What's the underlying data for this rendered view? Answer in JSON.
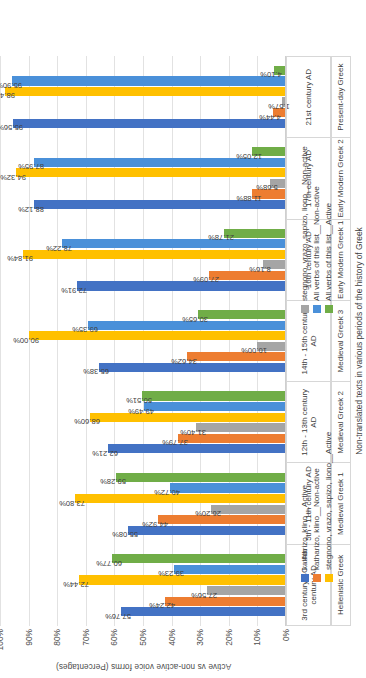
{
  "chart_data": {
    "type": "bar",
    "title": "",
    "ylabel": "Active vs non-active voice forms (Percentages)",
    "xlabel": "Non-translated texts in various periods of the history of Greek",
    "ylim": [
      0,
      100
    ],
    "ytick_labels": [
      "0%",
      "10%",
      "20%",
      "30%",
      "40%",
      "50%",
      "60%",
      "70%",
      "80%",
      "90%",
      "100%"
    ],
    "ytick_values": [
      0,
      10,
      20,
      30,
      40,
      50,
      60,
      70,
      80,
      90,
      100
    ],
    "grid": true,
    "legend_position": "bottom",
    "categories": [
      "3rd century BC - 4th century AD",
      "5th - 11th century AD",
      "12th - 13th century AD",
      "14th - 15th century AD",
      "16th century AD",
      "17th century AD",
      "21st century AD"
    ],
    "categories_sub": [
      "Hellenistic Greek",
      "Medieval Greek 1",
      "Medieval Greek 2",
      "Medieval Greek 3",
      "Early Modern Greek 1",
      "Early Modern Greek 2",
      "Present-day Greek"
    ],
    "series": [
      {
        "name": "katharizo, klino__Active",
        "color": "#4372c4",
        "values": [
          57.76,
          55.08,
          62.21,
          65.38,
          72.91,
          88.12,
          95.56
        ]
      },
      {
        "name": "katharizo, klino__Non-active",
        "color": "#ed7d31",
        "values": [
          42.24,
          44.92,
          37.79,
          34.62,
          27.09,
          11.88,
          4.44
        ]
      },
      {
        "name": "stegnono, vrazo, sapizo, liono__Non-active",
        "color": "#a5a5a5",
        "values": [
          27.56,
          26.2,
          31.4,
          10.0,
          8.16,
          5.68,
          1.57
        ]
      },
      {
        "name": "stegnono, vrazo, sapizo, liono__Active",
        "color": "#ffc000",
        "values": [
          72.44,
          73.8,
          68.6,
          90.0,
          91.84,
          94.32,
          98.43
        ]
      },
      {
        "name": "All verbs of this list__Non-active",
        "color": "#4a90d9",
        "values": [
          39.23,
          40.72,
          49.49,
          69.35,
          78.22,
          87.95,
          95.9
        ]
      },
      {
        "name": "All verbs of this list__Active",
        "color": "#70ad47",
        "values": [
          60.77,
          59.28,
          50.51,
          30.65,
          21.78,
          12.05,
          4.1
        ]
      }
    ],
    "data_labels": [
      [
        "57.76%",
        "42.24%",
        "27.56%",
        "72.44%",
        "39.23%",
        "60.77%"
      ],
      [
        "55.08%",
        "44.92%",
        "26.20%",
        "73.80%",
        "40.72%",
        "59.28%"
      ],
      [
        "62.21%",
        "37.79%",
        "31.40%",
        "68.60%",
        "49.49%",
        "50.51%"
      ],
      [
        "65.38%",
        "34.62%",
        "10.00%",
        "90.00%",
        "69.35%",
        "30.65%"
      ],
      [
        "72.91%",
        "27.09%",
        "8.16%",
        "91.84%",
        "78.22%",
        "21.78%"
      ],
      [
        "88.12%",
        "11.88%",
        "5.68%",
        "94.32%",
        "87.95%",
        "12.05%"
      ],
      [
        "95.56%",
        "4.44%",
        "1.57%",
        "98.43%",
        "95.90%",
        "4.10%"
      ]
    ],
    "legend": [
      {
        "label": "katharizo, klino__Active",
        "color": "#4372c4"
      },
      {
        "label": "katharizo, klino__Non-active",
        "color": "#ed7d31"
      },
      {
        "label": "stegnono, vrazo, sapizo, liono__Non-active",
        "color": "#a5a5a5"
      },
      {
        "label": "stegnono, vrazo, sapizo, liono__Active",
        "color": "#ffc000"
      },
      {
        "label": "All verbs of this list__Non-active",
        "color": "#4a90d9"
      },
      {
        "label": "All verbs of this list__Active",
        "color": "#70ad47"
      }
    ]
  }
}
